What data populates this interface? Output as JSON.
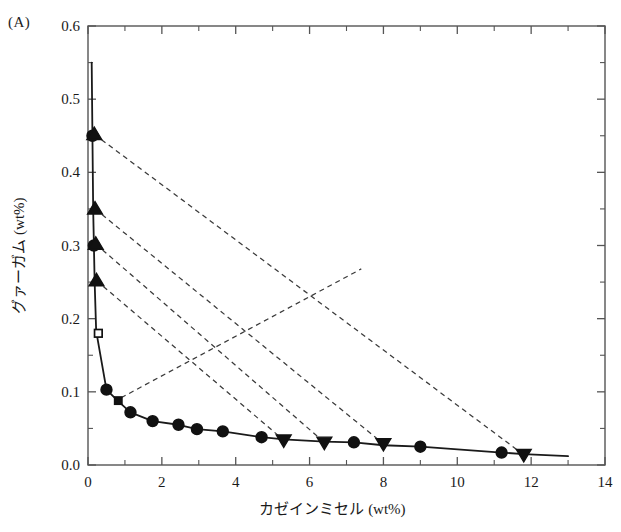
{
  "panel": {
    "label": "(A)"
  },
  "chart_data": {
    "type": "scatter",
    "title": "",
    "subtitle": "",
    "xlabel": "カゼインミセル (wt%)",
    "ylabel": "グァーガム (wt%)",
    "xlim": [
      0,
      14
    ],
    "ylim": [
      0.0,
      0.6
    ],
    "grid": false,
    "legend_position": "none",
    "x_ticks": [
      0,
      2,
      4,
      6,
      8,
      10,
      12,
      14
    ],
    "x_tick_labels": [
      "0",
      "2",
      "4",
      "6",
      "8",
      "10",
      "12",
      "14"
    ],
    "x_minor_ticks": [
      1,
      3,
      5,
      7,
      9,
      11,
      13
    ],
    "y_ticks": [
      0.0,
      0.1,
      0.2,
      0.3,
      0.4,
      0.5,
      0.6
    ],
    "y_tick_labels": [
      "0.0",
      "0.1",
      "0.2",
      "0.3",
      "0.4",
      "0.5",
      "0.6"
    ],
    "y_minor_ticks": [
      0.05,
      0.15,
      0.25,
      0.35,
      0.45,
      0.55
    ],
    "series": [
      {
        "name": "binodal-curve",
        "marker": "none",
        "line": "solid",
        "color": "#1a1a1a",
        "points": [
          [
            0.1,
            0.55
          ],
          [
            0.12,
            0.45
          ],
          [
            0.14,
            0.35
          ],
          [
            0.16,
            0.3
          ],
          [
            0.18,
            0.25
          ],
          [
            0.22,
            0.185
          ],
          [
            0.26,
            0.172
          ],
          [
            0.5,
            0.103
          ],
          [
            0.8,
            0.088
          ],
          [
            1.15,
            0.072
          ],
          [
            1.75,
            0.06
          ],
          [
            2.45,
            0.055
          ],
          [
            2.95,
            0.049
          ],
          [
            3.65,
            0.046
          ],
          [
            4.7,
            0.038
          ],
          [
            5.3,
            0.035
          ],
          [
            6.4,
            0.032
          ],
          [
            7.2,
            0.031
          ],
          [
            8.0,
            0.027
          ],
          [
            9.0,
            0.025
          ],
          [
            11.2,
            0.017
          ],
          [
            11.8,
            0.015
          ],
          [
            13.0,
            0.012
          ]
        ]
      },
      {
        "name": "binodal-circles",
        "marker": "circle",
        "filled": true,
        "color": "#111111",
        "points": [
          [
            0.12,
            0.45
          ],
          [
            0.16,
            0.3
          ],
          [
            0.5,
            0.103
          ],
          [
            1.15,
            0.072
          ],
          [
            1.75,
            0.06
          ],
          [
            2.45,
            0.055
          ],
          [
            2.95,
            0.049
          ],
          [
            3.65,
            0.046
          ],
          [
            4.7,
            0.038
          ],
          [
            7.2,
            0.031
          ],
          [
            9.0,
            0.025
          ],
          [
            11.2,
            0.017
          ]
        ]
      },
      {
        "name": "guar-rich-phase-up-triangles",
        "marker": "triangle-up",
        "filled": true,
        "color": "#111111",
        "points": [
          [
            0.17,
            0.452
          ],
          [
            0.19,
            0.35
          ],
          [
            0.21,
            0.302
          ],
          [
            0.23,
            0.252
          ]
        ]
      },
      {
        "name": "casein-rich-phase-down-triangles",
        "marker": "triangle-down",
        "filled": true,
        "color": "#111111",
        "points": [
          [
            5.3,
            0.034
          ],
          [
            6.4,
            0.031
          ],
          [
            8.0,
            0.029
          ],
          [
            11.8,
            0.014
          ]
        ]
      },
      {
        "name": "critical-point-open-square",
        "marker": "square",
        "filled": false,
        "color": "#111111",
        "points": [
          [
            0.28,
            0.18
          ]
        ]
      },
      {
        "name": "overall-composition-filled-square",
        "marker": "square",
        "filled": true,
        "color": "#111111",
        "points": [
          [
            0.82,
            0.088
          ]
        ]
      }
    ],
    "tie_lines": [
      {
        "name": "tie-line-1",
        "from": [
          0.17,
          0.452
        ],
        "to": [
          11.8,
          0.014
        ],
        "style": "dashed"
      },
      {
        "name": "tie-line-2",
        "from": [
          0.19,
          0.35
        ],
        "to": [
          8.0,
          0.029
        ],
        "style": "dashed"
      },
      {
        "name": "tie-line-3",
        "from": [
          0.21,
          0.302
        ],
        "to": [
          6.4,
          0.031
        ],
        "style": "dashed"
      },
      {
        "name": "tie-line-4",
        "from": [
          0.23,
          0.252
        ],
        "to": [
          5.3,
          0.034
        ],
        "style": "dashed"
      },
      {
        "name": "tie-line-5",
        "from": [
          0.9,
          0.092
        ],
        "to": [
          7.4,
          0.268
        ],
        "style": "dashed"
      }
    ]
  }
}
